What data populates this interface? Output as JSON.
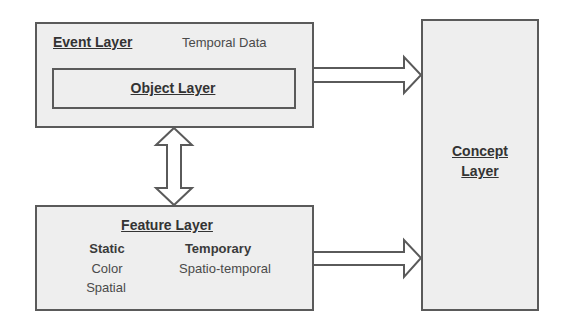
{
  "diagram": {
    "event_layer": {
      "title": "Event Layer",
      "note": "Temporal Data",
      "object_layer": {
        "title": "Object Layer"
      }
    },
    "feature_layer": {
      "title": "Feature Layer",
      "columns": [
        {
          "heading": "Static",
          "items": [
            "Color",
            "Spatial"
          ]
        },
        {
          "heading": "Temporary",
          "items": [
            "Spatio-temporal"
          ]
        }
      ]
    },
    "concept_layer": {
      "title_line1": "Concept",
      "title_line2": "Layer"
    },
    "connections": [
      {
        "from": "Event Layer",
        "to": "Concept Layer",
        "type": "single-arrow"
      },
      {
        "from": "Feature Layer",
        "to": "Concept Layer",
        "type": "single-arrow"
      },
      {
        "from": "Event Layer",
        "to": "Feature Layer",
        "type": "double-arrow"
      }
    ],
    "colors": {
      "box_fill": "#eeeeee",
      "box_border": "#5a5a5a",
      "text": "#333333"
    }
  }
}
